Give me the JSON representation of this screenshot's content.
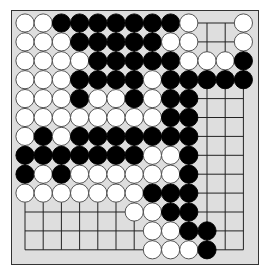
{
  "game": "go",
  "board": {
    "size": 13,
    "colors": {
      "board": "#dedede",
      "border": "#333333",
      "line": "#222222",
      "black": "#000000",
      "white": "#ffffff",
      "stone_outline": "#444444"
    },
    "legend": {
      "B": "black",
      "W": "white",
      ".": "empty"
    },
    "rows": [
      "WWBBBBBBBW..W",
      "WWWBBBBBWW..W",
      "WWWWBBBBBWWWB",
      "WWWBBBBWBBBBB",
      "WWWBWWBWBB...",
      "WWWWWWWWBB...",
      "WBWBBBBBBB...",
      "BBBBBBBWWB...",
      "BWBWWWWWWB...",
      "WWWWWWWBBB...",
      "......WWBB...",
      ".......WWBB..",
      ".......WWWB.."
    ]
  }
}
